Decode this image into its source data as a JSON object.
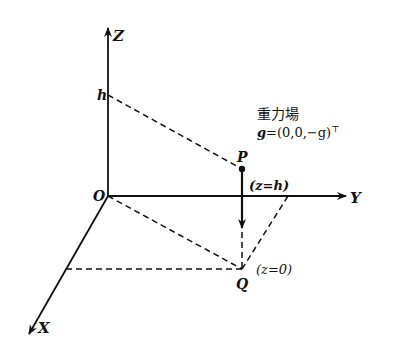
{
  "diagram": {
    "axes": {
      "z_label": "Z",
      "y_label": "Y",
      "x_label": "X",
      "origin_label": "O"
    },
    "height_label": "h",
    "points": {
      "p_label": "P",
      "q_label": "Q",
      "p_annotation": "(z=h)",
      "q_annotation": "(z=0)"
    },
    "field": {
      "title": "重力場",
      "vector_symbol": "g",
      "vector_value": "=(0,0,−g)",
      "transpose": "⊤"
    },
    "colors": {
      "ink": "#111111",
      "background": "#ffffff"
    }
  }
}
